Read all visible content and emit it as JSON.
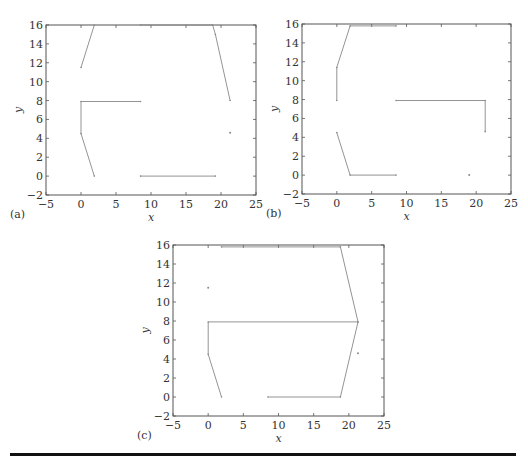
{
  "figure": {
    "panels": [
      "(a)",
      "(b)",
      "(c)"
    ],
    "xlabel": "x",
    "ylabel": "y",
    "xticks": [
      -5,
      0,
      5,
      10,
      15,
      20,
      25
    ],
    "yticks": [
      -2,
      0,
      2,
      4,
      6,
      8,
      10,
      12,
      14,
      16
    ]
  },
  "chart_data": [
    {
      "type": "line",
      "title": "(a)",
      "xlabel": "x",
      "ylabel": "y",
      "xlim": [
        -5,
        25
      ],
      "ylim": [
        -2,
        16
      ],
      "grid": false,
      "series": [
        {
          "name": "path1",
          "x": [
            0,
            1.9
          ],
          "y": [
            11.5,
            16
          ]
        },
        {
          "name": "path2",
          "x": [
            8.5,
            18.8,
            19.2,
            21.3
          ],
          "y": [
            16,
            16,
            15,
            8
          ]
        },
        {
          "name": "path3",
          "x": [
            8.5,
            0,
            0,
            1.9
          ],
          "y": [
            7.9,
            7.9,
            4.5,
            0
          ]
        },
        {
          "name": "path4",
          "x": [
            8.5,
            19.2
          ],
          "y": [
            0,
            0
          ]
        },
        {
          "name": "point1",
          "x": [
            21.3
          ],
          "y": [
            4.6
          ]
        }
      ]
    },
    {
      "type": "line",
      "title": "(b)",
      "xlabel": "x",
      "ylabel": "y",
      "xlim": [
        -5,
        25
      ],
      "ylim": [
        -2,
        16
      ],
      "grid": false,
      "series": [
        {
          "name": "path1",
          "x": [
            0,
            0,
            1.9,
            8.5
          ],
          "y": [
            7.9,
            11.4,
            15.8,
            15.8
          ]
        },
        {
          "name": "path2",
          "x": [
            8.5,
            21.3,
            21.3
          ],
          "y": [
            7.9,
            7.9,
            4.6
          ]
        },
        {
          "name": "path3",
          "x": [
            0,
            1.9,
            8.5
          ],
          "y": [
            4.5,
            0,
            0
          ]
        },
        {
          "name": "point1",
          "x": [
            19
          ],
          "y": [
            0
          ]
        }
      ]
    },
    {
      "type": "line",
      "title": "(c)",
      "xlabel": "x",
      "ylabel": "y",
      "xlim": [
        -5,
        25
      ],
      "ylim": [
        -2,
        16
      ],
      "grid": false,
      "series": [
        {
          "name": "path1",
          "x": [
            1.9,
            18.8,
            21.3,
            18.8,
            8.5
          ],
          "y": [
            15.8,
            15.8,
            7.9,
            0,
            0
          ]
        },
        {
          "name": "path2",
          "x": [
            21.3,
            0,
            0,
            1.9
          ],
          "y": [
            7.9,
            7.9,
            4.5,
            0
          ]
        },
        {
          "name": "point1",
          "x": [
            0
          ],
          "y": [
            11.5
          ]
        },
        {
          "name": "point2",
          "x": [
            21.3
          ],
          "y": [
            4.6
          ]
        }
      ]
    }
  ]
}
